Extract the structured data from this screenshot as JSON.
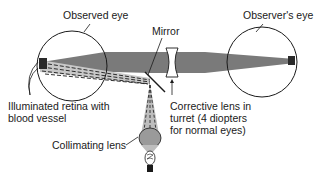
{
  "diagram": {
    "labels": {
      "observed_eye": "Observed eye",
      "observers_eye": "Observer's eye",
      "mirror": "Mirror",
      "retina_line1": "Illuminated retina with",
      "retina_line2": "blood vessel",
      "corrective_line1": "Corrective lens in",
      "corrective_line2": "turret (4 diopters",
      "corrective_line3": "for normal eyes)",
      "collimating_lens": "Collimating lens"
    },
    "colors": {
      "beam": "#7a7a7a",
      "beam_light": "#c8c8c8",
      "outline": "#1a1a1a",
      "background": "#ffffff"
    }
  }
}
